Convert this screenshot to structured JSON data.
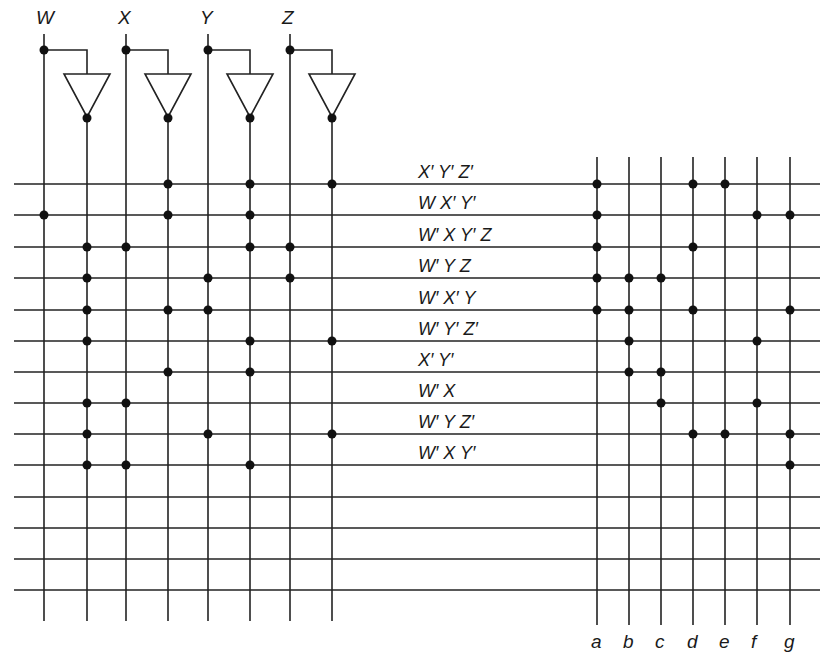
{
  "colors": {
    "line": "#222222",
    "dot": "#111111",
    "background": "#ffffff"
  },
  "inputs": [
    {
      "name": "W",
      "x": 44,
      "inv_x": 87
    },
    {
      "name": "X",
      "x": 126,
      "inv_x": 168
    },
    {
      "name": "Y",
      "x": 208,
      "inv_x": 250
    },
    {
      "name": "Z",
      "x": 290,
      "inv_x": 332
    }
  ],
  "rows_y": [
    184,
    215,
    247,
    278,
    310,
    341,
    372,
    403,
    434,
    465,
    497,
    528,
    559,
    590
  ],
  "product_terms": [
    {
      "label": "X′ Y′ Z′",
      "and": [
        168,
        250,
        332
      ],
      "or": [
        "a",
        "d",
        "e"
      ]
    },
    {
      "label": "W X′  Y′",
      "and": [
        44,
        168,
        250
      ],
      "or": [
        "a",
        "f",
        "g"
      ]
    },
    {
      "label": "W′ X Y′ Z",
      "and": [
        87,
        126,
        250,
        290
      ],
      "or": [
        "a",
        "d"
      ]
    },
    {
      "label": "W′ Y Z",
      "and": [
        87,
        208,
        290
      ],
      "or": [
        "a",
        "b",
        "c"
      ]
    },
    {
      "label": "W′ X′ Y",
      "and": [
        87,
        168,
        208
      ],
      "or": [
        "a",
        "b",
        "d",
        "g"
      ]
    },
    {
      "label": "W′ Y′ Z′",
      "and": [
        87,
        250,
        332
      ],
      "or": [
        "b",
        "f"
      ]
    },
    {
      "label": "X′ Y′",
      "and": [
        168,
        250
      ],
      "or": [
        "b",
        "c"
      ]
    },
    {
      "label": "W′ X",
      "and": [
        87,
        126
      ],
      "or": [
        "c",
        "f"
      ]
    },
    {
      "label": "W′ Y Z′",
      "and": [
        87,
        208,
        332
      ],
      "or": [
        "d",
        "e",
        "g"
      ]
    },
    {
      "label": "W′ X Y′",
      "and": [
        87,
        126,
        250
      ],
      "or": [
        "g"
      ]
    }
  ],
  "outputs": [
    {
      "name": "a",
      "x": 597
    },
    {
      "name": "b",
      "x": 629
    },
    {
      "name": "c",
      "x": 661
    },
    {
      "name": "d",
      "x": 693
    },
    {
      "name": "e",
      "x": 725
    },
    {
      "name": "f",
      "x": 757
    },
    {
      "name": "g",
      "x": 790
    }
  ],
  "geometry": {
    "row_x_start": 14,
    "row_x_end": 820,
    "input_top": 34,
    "input_bottom": 621,
    "tap_y": 50,
    "inv_top": 74,
    "inv_bottom": 117,
    "inv_half_width": 23,
    "inv_dot_y": 118,
    "out_top": 157,
    "out_bottom": 625,
    "label_x": 418,
    "out_label_y": 648,
    "dot_r": 4.5
  }
}
